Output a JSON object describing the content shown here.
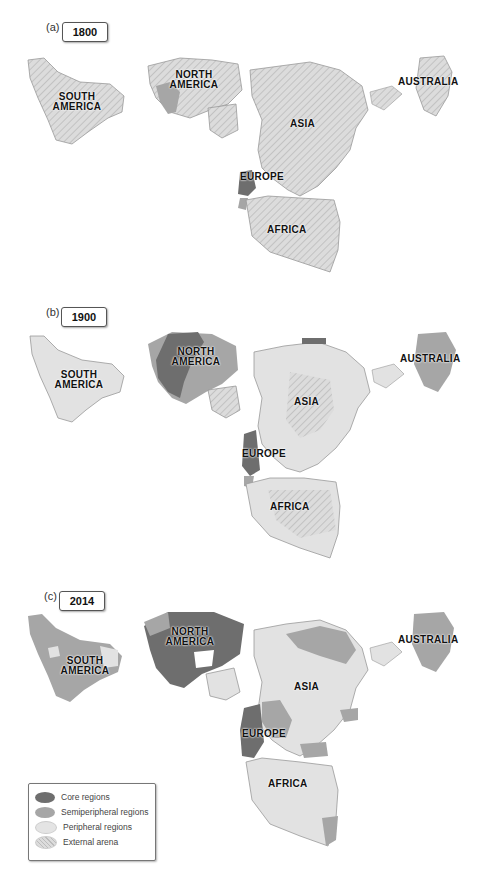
{
  "colors": {
    "core": "#6e6e6e",
    "semiperipheral": "#a6a6a6",
    "peripheral": "#e2e2e2",
    "external_fill": "#dadada",
    "external_hatch": "#b8b8b8",
    "outline": "#9a9a9a"
  },
  "panels": [
    {
      "letter": "(a)",
      "year": "1800",
      "labels": {
        "south_america": "SOUTH AMERICA",
        "north_america": "NORTH AMERICA",
        "asia": "ASIA",
        "europe": "EUROPE",
        "africa": "AFRICA",
        "australia": "AUSTRALIA"
      },
      "regions": {
        "south_america": "external",
        "north_america": "external",
        "north_america_east": "semiperipheral",
        "asia": "external",
        "europe_west": "core",
        "europe_south": "semiperipheral",
        "africa": "external",
        "australia": "external"
      }
    },
    {
      "letter": "(b)",
      "year": "1900",
      "labels": {
        "south_america": "SOUTH AMERICA",
        "north_america": "NORTH AMERICA",
        "asia": "ASIA",
        "europe": "EUROPE",
        "africa": "AFRICA",
        "australia": "AUSTRALIA"
      },
      "regions": {
        "south_america": "peripheral",
        "north_america": "core",
        "north_america_west": "semiperipheral",
        "asia": "peripheral",
        "europe_west": "core",
        "europe_south": "semiperipheral",
        "africa": "peripheral",
        "australia": "semiperipheral"
      }
    },
    {
      "letter": "(c)",
      "year": "2014",
      "labels": {
        "south_america": "SOUTH AMERICA",
        "north_america": "NORTH AMERICA",
        "asia": "ASIA",
        "europe": "EUROPE",
        "africa": "AFRICA",
        "australia": "AUSTRALIA"
      },
      "regions": {
        "south_america": "semiperipheral",
        "north_america": "core",
        "asia": "peripheral",
        "asia_north": "semiperipheral",
        "europe_west": "core",
        "europe_east": "semiperipheral",
        "africa": "peripheral",
        "africa_south": "semiperipheral",
        "australia": "semiperipheral"
      }
    }
  ],
  "legend": {
    "items": [
      {
        "label": "Core regions",
        "key": "core"
      },
      {
        "label": "Semiperipheral regions",
        "key": "semiperipheral"
      },
      {
        "label": "Peripheral regions",
        "key": "peripheral"
      },
      {
        "label": "External arena",
        "key": "external"
      }
    ]
  }
}
